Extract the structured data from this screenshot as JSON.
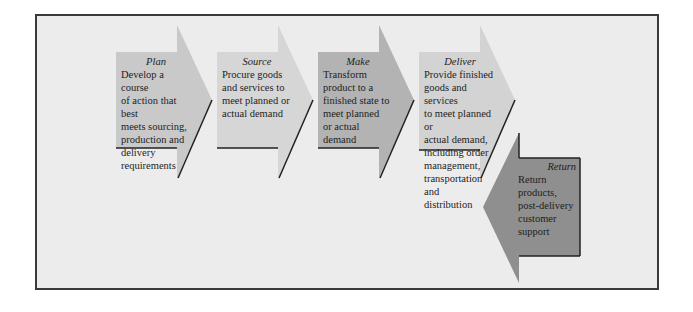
{
  "diagram": {
    "stages": [
      {
        "name": "Plan",
        "description": "Develop a course of action that best meets sourcing, production and delivery requirements",
        "lines": [
          "Develop a course",
          "of action that best",
          "meets sourcing,",
          "production and",
          "delivery",
          "requirements"
        ],
        "color": "#c9c9c9",
        "direction": "right"
      },
      {
        "name": "Source",
        "description": "Procure goods and services to meet planned or actual demand",
        "lines": [
          "Procure goods",
          "and services to",
          "meet planned or",
          "actual demand"
        ],
        "color": "#d6d6d6",
        "direction": "right"
      },
      {
        "name": "Make",
        "description": "Transform product to a finished state to meet planned or actual demand",
        "lines": [
          "Transform",
          "product to a",
          "finished state to",
          "meet planned",
          "or actual",
          "demand"
        ],
        "color": "#b3b3b3",
        "direction": "right"
      },
      {
        "name": "Deliver",
        "description": "Provide finished goods and services to meet planned or actual demand, including order management, transportation and distribution",
        "lines": [
          "Provide finished",
          "goods and services",
          "to meet planned or",
          "actual demand,",
          "including order",
          "management,",
          "transportation and",
          "distribution"
        ],
        "color": "#d3d3d3",
        "direction": "right"
      },
      {
        "name": "Return",
        "description": "Return products, post-delivery customer support",
        "lines": [
          "Return",
          "products,",
          "post-delivery",
          "customer",
          "support"
        ],
        "color": "#8f8f8f",
        "direction": "left"
      }
    ]
  }
}
